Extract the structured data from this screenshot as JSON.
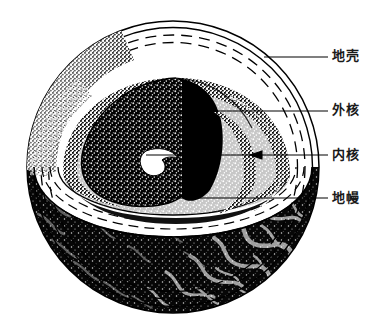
{
  "figure": {
    "style": "black-and-white stipple engraving",
    "background_color": "#ffffff",
    "ink_color": "#000000",
    "sphere": {
      "name": "earth-sphere",
      "center_x": 173,
      "center_y": 167,
      "radius": 147,
      "crust_shell_count": 4,
      "description": "地球球体剖切图，上半部切开显示内部结构"
    },
    "layers": [
      {
        "id": "crust",
        "label": "地壳",
        "fill": "#ffffff",
        "outline": "#000000",
        "description": "最外层薄壳，由同心实线与虚线表示"
      },
      {
        "id": "outer-core",
        "label": "外核",
        "fill": "#101010",
        "outline": "#000000",
        "description": "深色点刻楔形区域"
      },
      {
        "id": "inner-core",
        "label": "内核",
        "fill": "#ffffff",
        "outline": "#000000",
        "description": "核心处小白色楔形"
      },
      {
        "id": "mantle",
        "label": "地幔",
        "fill": "#0d0d0d",
        "outline": "#000000",
        "description": "下半球深色区域带白色纹理"
      }
    ],
    "callouts": [
      {
        "id": "callout-crust",
        "label": "地壳",
        "leader_from_x": 264,
        "leader_from_y": 57,
        "leader_to_x": 328,
        "leader_to_y": 57,
        "arrow": false
      },
      {
        "id": "callout-outer-core",
        "label": "外核",
        "leader_from_x": 176,
        "leader_from_y": 111,
        "leader_to_x": 328,
        "leader_to_y": 111,
        "arrow": false
      },
      {
        "id": "callout-inner-core",
        "label": "内核",
        "leader_from_x": 146,
        "leader_from_y": 155,
        "leader_to_x": 328,
        "leader_to_y": 155,
        "arrow": true
      },
      {
        "id": "callout-mantle",
        "label": "地幔",
        "leader_from_x": 166,
        "leader_from_y": 198,
        "leader_to_x": 328,
        "leader_to_y": 198,
        "arrow": false
      }
    ]
  }
}
